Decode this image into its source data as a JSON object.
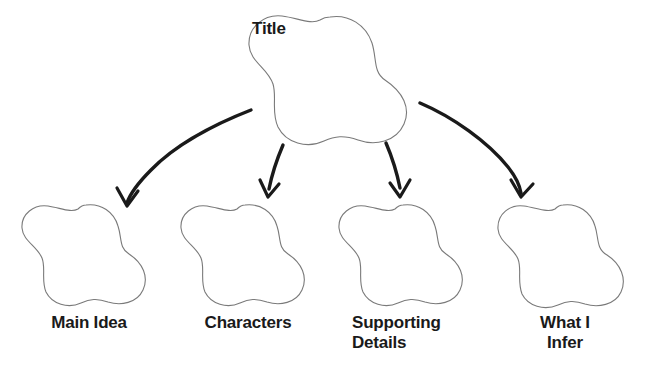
{
  "document": {
    "kind": "graphic-organizer",
    "background_color": "#ffffff",
    "ink_color": "#1a1a1a",
    "shape_outline_color": "#6b6b6b"
  },
  "title_node": {
    "label": "Title",
    "shape": "flower-5-petal"
  },
  "nodes": [
    {
      "id": "main-idea",
      "label": "Main Idea",
      "shape": "flower-5-petal"
    },
    {
      "id": "characters",
      "label": "Characters",
      "shape": "flower-5-petal"
    },
    {
      "id": "supporting-details",
      "label": "Supporting\nDetails",
      "shape": "flower-5-petal"
    },
    {
      "id": "what-i-infer",
      "label": "What I\nInfer",
      "shape": "flower-5-petal"
    }
  ],
  "connectors": [
    {
      "id": "arrow-to-main-idea",
      "from": "title_node",
      "to": "main-idea",
      "style": "curved-arrow"
    },
    {
      "id": "arrow-to-characters",
      "from": "title_node",
      "to": "characters",
      "style": "curved-arrow"
    },
    {
      "id": "arrow-to-supporting-details",
      "from": "title_node",
      "to": "supporting-details",
      "style": "curved-arrow"
    },
    {
      "id": "arrow-to-what-i-infer",
      "from": "title_node",
      "to": "what-i-infer",
      "style": "curved-arrow"
    }
  ]
}
